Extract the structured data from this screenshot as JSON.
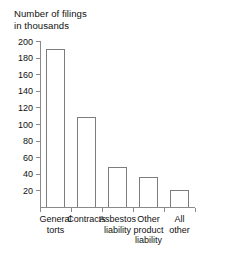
{
  "chart_data": {
    "type": "bar",
    "title": "Number of filings\nin thousands",
    "title_line1": "Number of filings",
    "title_line2": "in thousands",
    "xlabel": "",
    "ylabel": "Number of filings in thousands",
    "ylim": [
      0,
      200
    ],
    "grid": false,
    "legend": "none",
    "ytick_labels": [
      "200",
      "180",
      "160",
      "140",
      "120",
      "100",
      "80",
      "60",
      "40",
      "20"
    ],
    "ytick_values": [
      200,
      180,
      160,
      140,
      120,
      100,
      80,
      60,
      40,
      20
    ],
    "categories": [
      "General\ntorts",
      "Contracts",
      "Asbestos\nliability",
      "Other\nproduct\nliability",
      "All\nother"
    ],
    "category_labels": [
      "General torts",
      "Contracts",
      "Asbestos liability",
      "Other product liability",
      "All other"
    ],
    "values": [
      190,
      108,
      48,
      36,
      21
    ],
    "bar_fill": "#ffffff",
    "bar_edge": "#7d7d7d",
    "axis_color": "#8a8a8a",
    "background": "#ffffff"
  }
}
